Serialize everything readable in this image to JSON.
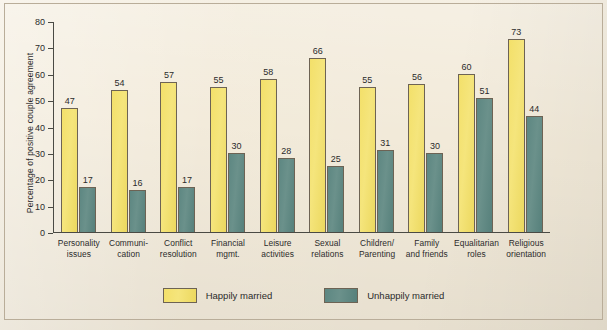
{
  "chart_data": {
    "type": "bar",
    "title": "",
    "xlabel": "",
    "ylabel": "Percentage of positive couple agreement",
    "ylim": [
      0,
      80
    ],
    "yticks": [
      0,
      10,
      20,
      30,
      40,
      50,
      60,
      70,
      80
    ],
    "grid": false,
    "legend_position": "bottom",
    "categories": [
      "Personality issues",
      "Communication",
      "Conflict resolution",
      "Financial mgmt.",
      "Leisure activities",
      "Sexual relations",
      "Children/Parenting",
      "Family and friends",
      "Equalitarian roles",
      "Religious orientation"
    ],
    "category_lines": [
      [
        "Personality",
        "issues"
      ],
      [
        "Communi-",
        "cation"
      ],
      [
        "Conflict",
        "resolution"
      ],
      [
        "Financial",
        "mgmt."
      ],
      [
        "Leisure",
        "activities"
      ],
      [
        "Sexual",
        "relations"
      ],
      [
        "Children/",
        "Parenting"
      ],
      [
        "Family",
        "and friends"
      ],
      [
        "Equalitarian",
        "roles"
      ],
      [
        "Religious",
        "orientation"
      ]
    ],
    "series": [
      {
        "name": "Happily married",
        "color": "#f2e070",
        "values": [
          47,
          54,
          57,
          55,
          58,
          66,
          55,
          56,
          60,
          73
        ]
      },
      {
        "name": "Unhappily married",
        "color": "#5f8a84",
        "values": [
          17,
          16,
          17,
          30,
          28,
          25,
          31,
          30,
          51,
          44
        ]
      }
    ]
  },
  "colors": {
    "background": "#f2ead9",
    "bar_outline": "#6d6354",
    "axis": "#4a4a44",
    "text": "#2b2b2b",
    "happy": "#f2e070",
    "unhappy": "#5f8a84"
  }
}
